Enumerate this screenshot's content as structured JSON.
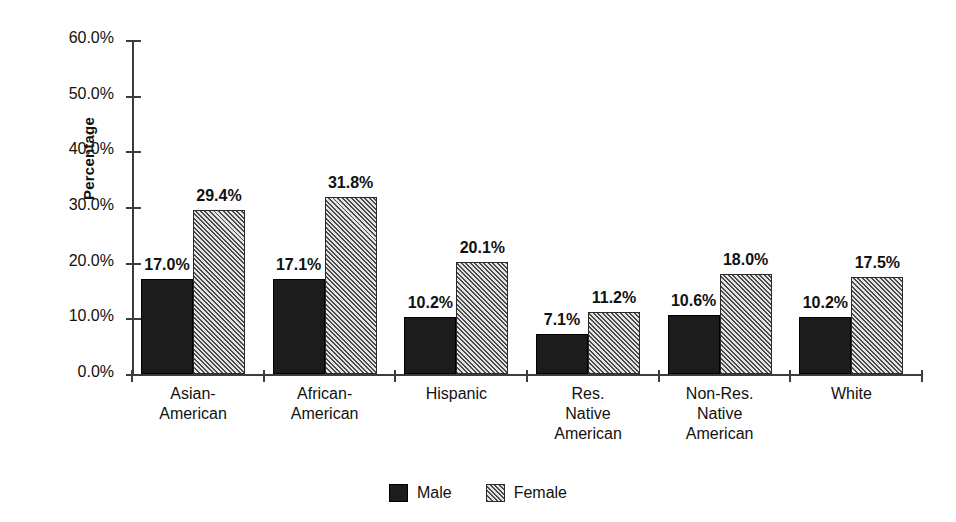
{
  "chart_data": {
    "type": "bar",
    "title": "",
    "xlabel": "",
    "ylabel": "Percentage",
    "ylim": [
      0,
      60
    ],
    "ytick_labels": [
      "0.0%",
      "10.0%",
      "20.0%",
      "30.0%",
      "40.0%",
      "50.0%",
      "60.0%"
    ],
    "ytick_values": [
      0,
      10,
      20,
      30,
      40,
      50,
      60
    ],
    "grid": false,
    "legend_position": "bottom-center",
    "categories": [
      "Asian-\nAmerican",
      "African-\nAmerican",
      "Hispanic",
      "Res.\nNative\nAmerican",
      "Non-Res.\nNative\nAmerican",
      "White"
    ],
    "category_lines": [
      [
        "Asian-",
        "American"
      ],
      [
        "African-",
        "American"
      ],
      [
        "Hispanic"
      ],
      [
        "Res.",
        "Native",
        "American"
      ],
      [
        "Non-Res.",
        "Native",
        "American"
      ],
      [
        "White"
      ]
    ],
    "series": [
      {
        "name": "Male",
        "values": [
          17.0,
          17.1,
          10.2,
          7.1,
          10.6,
          10.2
        ],
        "labels": [
          "17.0%",
          "17.1%",
          "10.2%",
          "7.1%",
          "10.6%",
          "10.2%"
        ],
        "color": "#1c1c1c",
        "fill": "solid"
      },
      {
        "name": "Female",
        "values": [
          29.4,
          31.8,
          20.1,
          11.2,
          18.0,
          17.5
        ],
        "labels": [
          "29.4%",
          "31.8%",
          "20.1%",
          "11.2%",
          "18.0%",
          "17.5%"
        ],
        "color": "#c9c9c9",
        "fill": "diagonal-hatch"
      }
    ]
  },
  "legend": {
    "items": [
      {
        "label": "Male",
        "fill": "solid"
      },
      {
        "label": "Female",
        "fill": "diagonal-hatch"
      }
    ]
  }
}
